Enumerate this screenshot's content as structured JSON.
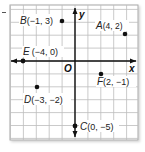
{
  "chart_data": {
    "type": "scatter",
    "title": "",
    "xlabel": "x",
    "ylabel": "y",
    "origin_label": "O",
    "xlim": [
      -5,
      5
    ],
    "ylim": [
      -6,
      4
    ],
    "grid": true,
    "points": [
      {
        "label": "A",
        "x": 4,
        "y": 2,
        "text": "A(4, 2)"
      },
      {
        "label": "B",
        "x": -1,
        "y": 3,
        "text": "B(−1, 3)"
      },
      {
        "label": "C",
        "x": 0,
        "y": -5,
        "text": "C(0, −5)"
      },
      {
        "label": "D",
        "x": -3,
        "y": -2,
        "text": "D(−3, −2)"
      },
      {
        "label": "E",
        "x": -4,
        "y": 0,
        "text": "E(−4, 0)"
      },
      {
        "label": "F",
        "x": 2,
        "y": -1,
        "text": "F(2, −1)"
      }
    ]
  },
  "labels": {
    "x_axis": "x",
    "y_axis": "y",
    "origin": "O",
    "A": {
      "name": "A",
      "coords": "(4, 2)"
    },
    "B": {
      "name": "B",
      "coords": "(−1, 3)"
    },
    "C": {
      "name": "C",
      "coords": "(0, −5)"
    },
    "D": {
      "name": "D",
      "coords": "(−3, −2)"
    },
    "E": {
      "name": "E",
      "coords": "(−4, 0)"
    },
    "F": {
      "name": "F",
      "coords": "(2, −1)"
    }
  },
  "colors": {
    "grid": "#b9b9b9",
    "border": "#a8a8a8",
    "axis": "#111111",
    "point": "#111111",
    "label": "#222222"
  }
}
